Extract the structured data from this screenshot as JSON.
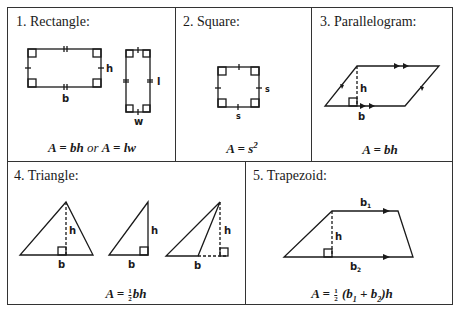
{
  "cells": [
    {
      "title": "1.  Rectangle:",
      "formula_a": "A",
      "formula_eq1": " = ",
      "formula_bh": "bh",
      "formula_or": " or ",
      "formula_a2": "A",
      "formula_eq2": " = ",
      "formula_lw": "lw",
      "labels": {
        "b": "b",
        "h": "h",
        "l": "l",
        "w": "w"
      }
    },
    {
      "title": "2.  Square:",
      "formula_main": "A = s",
      "formula_exp": "2",
      "labels": {
        "s_right": "s",
        "s_bottom": "s"
      }
    },
    {
      "title": "3.  Parallelogram:",
      "formula": "A = bh",
      "labels": {
        "h": "h",
        "b": "b"
      }
    },
    {
      "title": "4.  Triangle:",
      "formula_lhs": "A = ",
      "frac_num": "1",
      "frac_den": "2",
      "formula_rhs": "bh",
      "labels": {
        "h1": "h",
        "b1": "b",
        "h2": "h",
        "b2": "b",
        "h3": "h",
        "b3": "b"
      }
    },
    {
      "title": "5.  Trapezoid:",
      "formula_lhs": "A = ",
      "frac_num": "1",
      "frac_den": "2",
      "formula_open": " (b",
      "sub1": "1",
      "formula_plus": " + b",
      "sub2": "2",
      "formula_close": ")h",
      "labels": {
        "b1": "b",
        "b1_sub": "1",
        "b2": "b",
        "b2_sub": "2",
        "h": "h"
      }
    }
  ],
  "colors": {
    "line": "#1a1a1a",
    "border": "#333333",
    "background": "#ffffff"
  }
}
